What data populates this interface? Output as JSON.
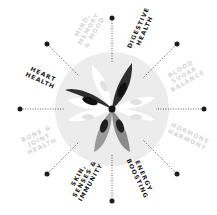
{
  "diagram": {
    "type": "radial wheel",
    "colors": {
      "circle": "#ececec",
      "active_text": "#1c1c1c",
      "inactive_text": "#d6d6d6",
      "petal_dark": "#2e2e2e",
      "petal_mid": "#9a9a9a",
      "petal_white": "#ffffff",
      "dot": "#1c1c1c"
    },
    "center_icon": "flower-icon",
    "segments": [
      {
        "label": "MIND,\nMEMORY\n& MOOD",
        "active": false
      },
      {
        "label": "DIGESTIVE\nHEALTH",
        "active": true
      },
      {
        "label": "BLOOD\nSUGAR\nBALANCE",
        "active": false
      },
      {
        "label": "HORMONE\nHARMONY",
        "active": false
      },
      {
        "label": "ENERGY\nBOOSTING",
        "active": true
      },
      {
        "label": "SKIN,\nSENSES &\nIMMUNITY",
        "active": true
      },
      {
        "label": "BONE &\nJOINT\nHEALTH",
        "active": false
      },
      {
        "label": "HEART\nHEALTH",
        "active": true
      }
    ]
  }
}
